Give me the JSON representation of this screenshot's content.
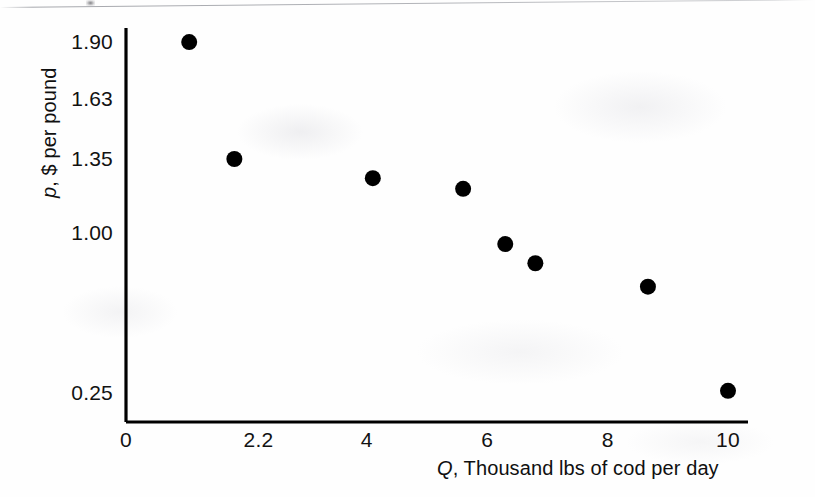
{
  "chart_data": {
    "type": "scatter",
    "title": "",
    "subtitle": "",
    "xlabel": "Q, Thousand lbs of cod per day",
    "xlabel_variable": "Q",
    "xlabel_rest": ", Thousand lbs of cod per day",
    "ylabel": "p, $ per pound",
    "ylabel_variable": "p",
    "ylabel_rest": ", $ per pound",
    "xlim": [
      0,
      10.6
    ],
    "ylim": [
      0,
      2.02
    ],
    "grid": false,
    "legend": null,
    "x_ticks": [
      {
        "value": 0,
        "label": "0"
      },
      {
        "value": 2.2,
        "label": "2.2"
      },
      {
        "value": 4,
        "label": "4"
      },
      {
        "value": 6,
        "label": "6"
      },
      {
        "value": 8,
        "label": "8"
      },
      {
        "value": 10,
        "label": "10"
      }
    ],
    "y_ticks": [
      {
        "value": 0.25,
        "label": "0.25"
      },
      {
        "value": 1.0,
        "label": "1.00"
      },
      {
        "value": 1.35,
        "label": "1.35"
      },
      {
        "value": 1.63,
        "label": "1.63"
      },
      {
        "value": 1.9,
        "label": "1.90"
      }
    ],
    "marker": {
      "shape": "circle",
      "color": "#000000",
      "radius_px": 8
    },
    "series": [
      {
        "name": "cod demand observations",
        "color": "#000000",
        "points": [
          {
            "x": 1.05,
            "y": 1.9
          },
          {
            "x": 1.8,
            "y": 1.35
          },
          {
            "x": 4.1,
            "y": 1.26
          },
          {
            "x": 5.6,
            "y": 1.21
          },
          {
            "x": 6.3,
            "y": 0.95
          },
          {
            "x": 6.8,
            "y": 0.86
          },
          {
            "x": 8.67,
            "y": 0.75
          },
          {
            "x": 10.0,
            "y": 0.26
          }
        ]
      }
    ],
    "x": [
      1.05,
      1.8,
      4.1,
      5.6,
      6.3,
      6.8,
      8.67,
      10.0
    ],
    "values": [
      1.9,
      1.35,
      1.26,
      1.21,
      0.95,
      0.86,
      0.75,
      0.26
    ],
    "axis_color": "#000000"
  },
  "figure": {
    "background": "#ffffff",
    "ink_color": "#111111"
  }
}
